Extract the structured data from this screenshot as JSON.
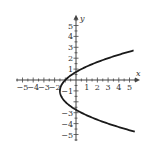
{
  "chart_data": {
    "type": "line",
    "title": "",
    "xlabel": "x",
    "ylabel": "y",
    "xlim": [
      -5.5,
      5.5
    ],
    "ylim": [
      -5.5,
      5.5
    ],
    "grid": false,
    "legend": null,
    "x_ticks": [
      -5,
      -4,
      -3,
      -2,
      -1,
      1,
      2,
      3,
      4,
      5
    ],
    "y_ticks": [
      -5,
      -4,
      -3,
      -2,
      -1,
      1,
      2,
      3,
      4,
      5
    ],
    "x_tick_labels": [
      "-5",
      "-4",
      "-3",
      "-2",
      "1",
      "2",
      "3",
      "4",
      "5"
    ],
    "y_tick_labels": [
      "5",
      "4",
      "3",
      "2",
      "1",
      "-1",
      "-3",
      "-4",
      "-5"
    ],
    "series": [
      {
        "name": "parabola",
        "equation": "x = 0.5(y+1)^2 - 1.5",
        "points": [
          {
            "x": 5.5,
            "y": -4.74
          },
          {
            "x": 4.5,
            "y": -4.46
          },
          {
            "x": 3.5,
            "y": -4.16
          },
          {
            "x": 2.5,
            "y": -3.83
          },
          {
            "x": 1.5,
            "y": -3.45
          },
          {
            "x": 0.5,
            "y": -3.0
          },
          {
            "x": 0,
            "y": -2.73
          },
          {
            "x": -0.5,
            "y": -2.41
          },
          {
            "x": -1.0,
            "y": -2.0
          },
          {
            "x": -1.5,
            "y": -1.0
          },
          {
            "x": -1.0,
            "y": 0.0
          },
          {
            "x": -0.5,
            "y": 0.41
          },
          {
            "x": 0,
            "y": 0.73
          },
          {
            "x": 0.5,
            "y": 1.0
          },
          {
            "x": 1.5,
            "y": 1.45
          },
          {
            "x": 2.5,
            "y": 1.83
          },
          {
            "x": 3.5,
            "y": 2.16
          },
          {
            "x": 4.5,
            "y": 2.46
          },
          {
            "x": 5.5,
            "y": 2.74
          }
        ]
      }
    ]
  },
  "labels": {
    "x_axis": "x",
    "y_axis": "y"
  }
}
